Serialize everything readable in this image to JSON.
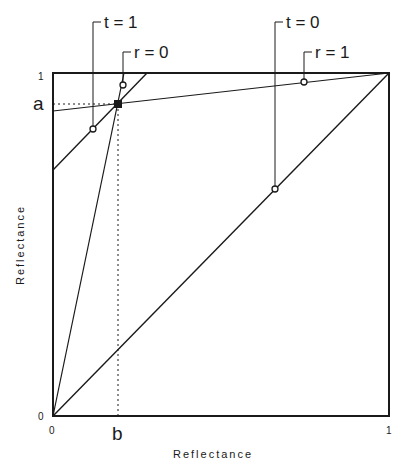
{
  "header_fragment": "",
  "diagram": {
    "x_axis": {
      "title": "Reflectance",
      "ticks": [
        "0",
        "1"
      ],
      "marker_label": "b"
    },
    "y_axis": {
      "title": "Reflectance",
      "ticks": [
        "0",
        "1"
      ],
      "marker_label": "a"
    },
    "annotations": {
      "t1": "t = 1",
      "r0": "r = 0",
      "t0": "t = 0",
      "r1": "r = 1"
    },
    "colors": {
      "ink": "#1a1a1a",
      "background": "#ffffff"
    }
  }
}
